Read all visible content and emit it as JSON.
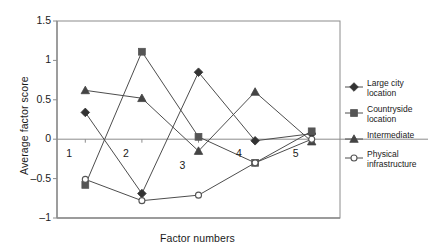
{
  "chart_data": {
    "type": "line",
    "title": "",
    "xlabel": "Factor numbers",
    "ylabel": "Average factor score",
    "categories": [
      "1",
      "2",
      "3",
      "4",
      "5"
    ],
    "ylim": [
      -1,
      1.5
    ],
    "yticks": [
      "-1",
      "-0.5",
      "0",
      "0.5",
      "1",
      "1.5"
    ],
    "ytick_values": [
      -1,
      -0.5,
      0,
      0.5,
      1,
      1.5
    ],
    "grid": false,
    "legend_position": "right",
    "zero_line": true,
    "series": [
      {
        "name": "Large city location",
        "marker": "filled-diamond",
        "color": "#333333",
        "values": [
          0.34,
          -0.69,
          0.85,
          -0.02,
          0.07
        ]
      },
      {
        "name": "Countryside location",
        "marker": "filled-square",
        "color": "#555555",
        "values": [
          -0.58,
          1.11,
          0.03,
          -0.3,
          0.1
        ]
      },
      {
        "name": "Intermediate",
        "marker": "filled-triangle",
        "color": "#444444",
        "values": [
          0.62,
          0.52,
          -0.15,
          0.6,
          -0.03
        ]
      },
      {
        "name": "Physical infrastructure",
        "marker": "open-circle",
        "color": "#555555",
        "values": [
          -0.51,
          -0.78,
          -0.71,
          -0.3,
          0.0
        ]
      }
    ]
  },
  "legend": {
    "items": [
      {
        "label_line1": "Large city",
        "label_line2": "location"
      },
      {
        "label_line1": "Countryside",
        "label_line2": "location"
      },
      {
        "label_line1": "Intermediate",
        "label_line2": ""
      },
      {
        "label_line1": "Physical",
        "label_line2": "infrastructure"
      }
    ]
  },
  "colors": {
    "axis": "#8c8c8c",
    "line": "#4d4d4d",
    "text": "#1a1a1a",
    "background": "#ffffff"
  }
}
